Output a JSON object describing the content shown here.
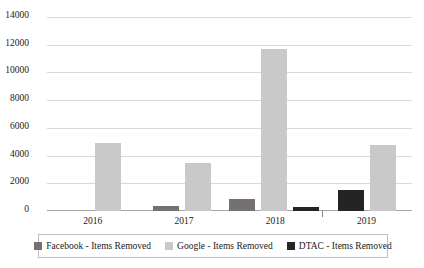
{
  "chart_data": {
    "type": "bar",
    "title": "",
    "subtitle": "",
    "xlabel": "",
    "ylabel": "",
    "categories": [
      "2016",
      "2017",
      "2018",
      "2019"
    ],
    "ylim": [
      0,
      14000
    ],
    "ytick_labels": [
      "14000",
      "12000",
      "10000",
      "8000",
      "6000",
      "4000",
      "2000",
      "0"
    ],
    "ytick_values": [
      14000,
      12000,
      10000,
      8000,
      6000,
      4000,
      2000,
      0
    ],
    "grid": true,
    "legend_position": "bottom",
    "series": [
      {
        "name": "Facebook - Items Removed",
        "color": "#767171",
        "key": "facebook",
        "values": [
          0,
          350,
          900,
          0
        ]
      },
      {
        "name": "Google - Items Removed",
        "color": "#c9c9c9",
        "key": "google",
        "values": [
          4900,
          3450,
          11700,
          4800
        ]
      },
      {
        "name": "DTAC - Items Removed",
        "color": "#242424",
        "key": "dtac",
        "values": [
          0,
          0,
          300,
          1500
        ]
      }
    ]
  },
  "legend": {
    "items": [
      {
        "label": "Facebook - Items Removed",
        "key": "facebook"
      },
      {
        "label": "Google - Items Removed",
        "key": "google"
      },
      {
        "label": "DTAC - Items Removed",
        "key": "dtac"
      }
    ]
  }
}
